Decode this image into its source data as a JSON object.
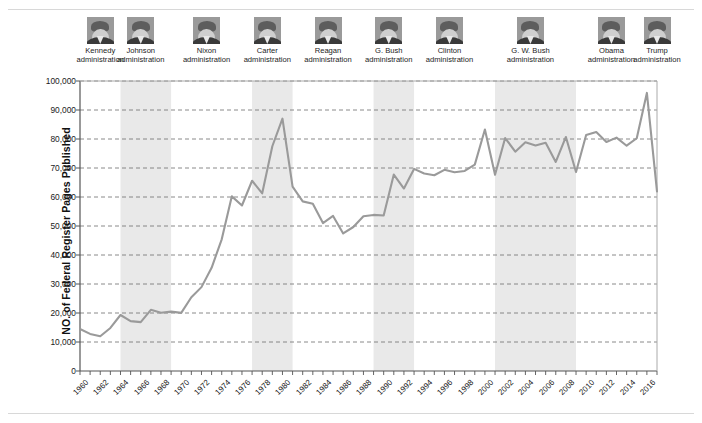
{
  "figure": {
    "y_axis_title": "NO. of Federal Register Pages Published"
  },
  "administrations": [
    {
      "name": "Kennedy",
      "sub": "administration",
      "icon": "portrait-photo",
      "start": 1961,
      "end": 1963,
      "shaded": false
    },
    {
      "name": "Johnson",
      "sub": "administration",
      "icon": "portrait-photo",
      "start": 1964,
      "end": 1968,
      "shaded": true
    },
    {
      "name": "Nixon",
      "sub": "administration",
      "icon": "portrait-photo",
      "start": 1969,
      "end": 1976,
      "shaded": false
    },
    {
      "name": "Carter",
      "sub": "administration",
      "icon": "portrait-photo",
      "start": 1977,
      "end": 1980,
      "shaded": true
    },
    {
      "name": "Reagan",
      "sub": "administration",
      "icon": "portrait-photo",
      "start": 1981,
      "end": 1988,
      "shaded": false
    },
    {
      "name": "G. Bush",
      "sub": "administration",
      "icon": "portrait-photo",
      "start": 1989,
      "end": 1992,
      "shaded": true
    },
    {
      "name": "Clinton",
      "sub": "administration",
      "icon": "portrait-photo",
      "start": 1993,
      "end": 2000,
      "shaded": false
    },
    {
      "name": "G. W. Bush",
      "sub": "administration",
      "icon": "portrait-photo",
      "start": 2001,
      "end": 2008,
      "shaded": true
    },
    {
      "name": "Obama",
      "sub": "administration",
      "icon": "portrait-photo",
      "start": 2009,
      "end": 2016,
      "shaded": false
    },
    {
      "name": "Trump",
      "sub": "administration",
      "icon": "portrait-photo",
      "start": 2017,
      "end": 2017,
      "shaded": false
    }
  ],
  "chart_data": {
    "type": "line",
    "title": "",
    "xlabel": "",
    "ylabel": "NO. of Federal Register Pages Published",
    "xlim": [
      1960,
      2017
    ],
    "ylim": [
      0,
      100000
    ],
    "grid": true,
    "legend": "none",
    "line_color": "#9a9a9a",
    "shade_color": "#e9e9e9",
    "y_ticks": [
      0,
      10000,
      20000,
      30000,
      40000,
      50000,
      60000,
      70000,
      80000,
      90000,
      100000
    ],
    "y_tick_labels": [
      "0",
      "10,000",
      "20,000",
      "30,000",
      "40,000",
      "50,000",
      "60,000",
      "70,000",
      "80,000",
      "90,000",
      "100,000"
    ],
    "x_tick_labels": [
      "1960",
      "1962",
      "1964",
      "1966",
      "1968",
      "1970",
      "1972",
      "1974",
      "1976",
      "1978",
      "1980",
      "1982",
      "1984",
      "1986",
      "1988",
      "1990",
      "1992",
      "1994",
      "1996",
      "1998",
      "2000",
      "2002",
      "2004",
      "2006",
      "2008",
      "2010",
      "2012",
      "2014",
      "2016"
    ],
    "x": [
      1960,
      1961,
      1962,
      1963,
      1964,
      1965,
      1966,
      1967,
      1968,
      1969,
      1970,
      1971,
      1972,
      1973,
      1974,
      1975,
      1976,
      1977,
      1978,
      1979,
      1980,
      1981,
      1982,
      1983,
      1984,
      1985,
      1986,
      1987,
      1988,
      1989,
      1990,
      1991,
      1992,
      1993,
      1994,
      1995,
      1996,
      1997,
      1998,
      1999,
      2000,
      2001,
      2002,
      2003,
      2004,
      2005,
      2006,
      2007,
      2008,
      2009,
      2010,
      2011,
      2012,
      2013,
      2014,
      2015,
      2016,
      2017
    ],
    "series": [
      {
        "name": "Federal Register pages published",
        "values": [
          14479,
          12792,
          12000,
          14842,
          19304,
          17206,
          16850,
          21087,
          20068,
          20464,
          20036,
          25442,
          28924,
          35586,
          45422,
          60221,
          57072,
          65603,
          61261,
          77498,
          87012,
          63554,
          58494,
          57704,
          50998,
          53480,
          47418,
          49654,
          53376,
          53822,
          53620,
          67716,
          62928,
          69688,
          68108,
          67518,
          69368,
          68530,
          68981,
          71161,
          83294,
          67702,
          80332,
          75606,
          78851,
          77752,
          78724,
          72090,
          80700,
          68598,
          81405,
          82415,
          78961,
          80462,
          77687,
          80260,
          95894,
          61950
        ]
      }
    ],
    "shaded_bands": [
      {
        "label": "Johnson administration",
        "start": 1964,
        "end": 1969
      },
      {
        "label": "Carter administration",
        "start": 1977,
        "end": 1981
      },
      {
        "label": "G. Bush administration",
        "start": 1989,
        "end": 1993
      },
      {
        "label": "G. W. Bush administration",
        "start": 2001,
        "end": 2009
      }
    ],
    "notable_points": [
      {
        "year": 1980,
        "value": 87012,
        "note": "Carter-era peak"
      },
      {
        "year": 2016,
        "value": 95894,
        "note": "all-time peak"
      },
      {
        "year": 2017,
        "value": 61950,
        "note": "sharp drop"
      }
    ]
  }
}
